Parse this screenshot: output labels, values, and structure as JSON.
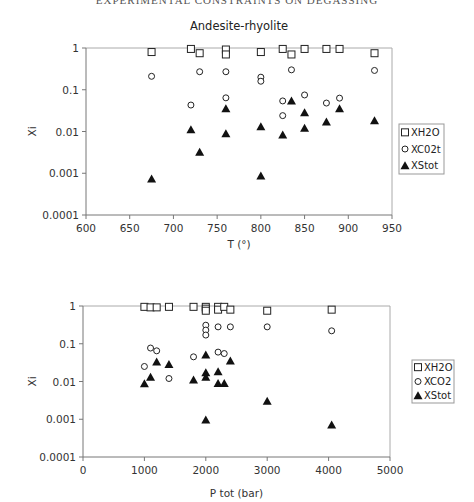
{
  "page": {
    "header": "EXPERIMENTAL CONSTRAINTS ON DEGASSING"
  },
  "chart_data": [
    {
      "type": "scatter",
      "title": "Andesite-rhyolite",
      "xlabel": "T (°)",
      "ylabel": "Xi",
      "xlim": [
        600,
        950
      ],
      "ylim": [
        0.0001,
        1
      ],
      "yscale": "log",
      "xticks": [
        "600",
        "650",
        "700",
        "750",
        "800",
        "850",
        "900",
        "950"
      ],
      "yticks": [
        "1",
        "0.1",
        "0.01",
        "0.001",
        "0.0001"
      ],
      "grid": false,
      "legend_position": "right",
      "legend": [
        "XH2O",
        "XC02t",
        "XStot"
      ],
      "series": [
        {
          "name": "XH2O",
          "marker": "open-square",
          "points": [
            [
              675,
              0.8
            ],
            [
              720,
              0.95
            ],
            [
              730,
              0.75
            ],
            [
              760,
              0.92
            ],
            [
              760,
              0.7
            ],
            [
              800,
              0.8
            ],
            [
              825,
              0.95
            ],
            [
              835,
              0.7
            ],
            [
              850,
              0.95
            ],
            [
              875,
              0.95
            ],
            [
              890,
              0.95
            ],
            [
              930,
              0.75
            ]
          ]
        },
        {
          "name": "XC02t",
          "marker": "open-circle",
          "points": [
            [
              675,
              0.21
            ],
            [
              720,
              0.043
            ],
            [
              730,
              0.27
            ],
            [
              760,
              0.27
            ],
            [
              760,
              0.064
            ],
            [
              800,
              0.2
            ],
            [
              800,
              0.16
            ],
            [
              825,
              0.054
            ],
            [
              825,
              0.024
            ],
            [
              835,
              0.3
            ],
            [
              850,
              0.075
            ],
            [
              875,
              0.048
            ],
            [
              890,
              0.063
            ],
            [
              930,
              0.29
            ]
          ]
        },
        {
          "name": "XStot",
          "marker": "filled-triangle",
          "points": [
            [
              675,
              0.00073
            ],
            [
              720,
              0.011
            ],
            [
              730,
              0.0032
            ],
            [
              760,
              0.035
            ],
            [
              760,
              0.0088
            ],
            [
              800,
              0.013
            ],
            [
              800,
              0.00086
            ],
            [
              825,
              0.0083
            ],
            [
              835,
              0.054
            ],
            [
              850,
              0.028
            ],
            [
              850,
              0.012
            ],
            [
              875,
              0.017
            ],
            [
              890,
              0.035
            ],
            [
              930,
              0.018
            ]
          ]
        }
      ]
    },
    {
      "type": "scatter",
      "title": "",
      "xlabel": "P tot (bar)",
      "ylabel": "Xi",
      "xlim": [
        0,
        5000
      ],
      "ylim": [
        0.0001,
        1
      ],
      "yscale": "log",
      "xticks": [
        "0",
        "1000",
        "2000",
        "3000",
        "4000",
        "5000"
      ],
      "yticks": [
        "1",
        "0.1",
        "0.01",
        "0.001",
        "0.0001"
      ],
      "grid": false,
      "legend_position": "right",
      "legend": [
        "XH2O",
        "XCO2",
        "XStot"
      ],
      "series": [
        {
          "name": "XH2O",
          "marker": "open-square",
          "points": [
            [
              1000,
              0.95
            ],
            [
              1100,
              0.92
            ],
            [
              1200,
              0.92
            ],
            [
              1400,
              0.95
            ],
            [
              1800,
              0.95
            ],
            [
              2000,
              0.95
            ],
            [
              2000,
              0.85
            ],
            [
              2000,
              0.75
            ],
            [
              2200,
              0.95
            ],
            [
              2200,
              0.8
            ],
            [
              2300,
              0.95
            ],
            [
              2400,
              0.8
            ],
            [
              3000,
              0.75
            ],
            [
              4050,
              0.8
            ]
          ]
        },
        {
          "name": "XCO2",
          "marker": "open-circle",
          "points": [
            [
              1000,
              0.025
            ],
            [
              1100,
              0.077
            ],
            [
              1200,
              0.065
            ],
            [
              1400,
              0.012
            ],
            [
              1800,
              0.045
            ],
            [
              2000,
              0.31
            ],
            [
              2000,
              0.23
            ],
            [
              2000,
              0.17
            ],
            [
              2200,
              0.28
            ],
            [
              2200,
              0.06
            ],
            [
              2300,
              0.055
            ],
            [
              2400,
              0.28
            ],
            [
              3000,
              0.28
            ],
            [
              4050,
              0.22
            ]
          ]
        },
        {
          "name": "XStot",
          "marker": "filled-triangle",
          "points": [
            [
              1000,
              0.0087
            ],
            [
              1100,
              0.013
            ],
            [
              1200,
              0.033
            ],
            [
              1400,
              0.028
            ],
            [
              1800,
              0.011
            ],
            [
              2000,
              0.05
            ],
            [
              2000,
              0.017
            ],
            [
              2000,
              0.013
            ],
            [
              2000,
              0.00095
            ],
            [
              2200,
              0.018
            ],
            [
              2200,
              0.0088
            ],
            [
              2300,
              0.0088
            ],
            [
              2400,
              0.035
            ],
            [
              3000,
              0.003
            ],
            [
              4050,
              0.0007
            ]
          ]
        }
      ]
    }
  ]
}
